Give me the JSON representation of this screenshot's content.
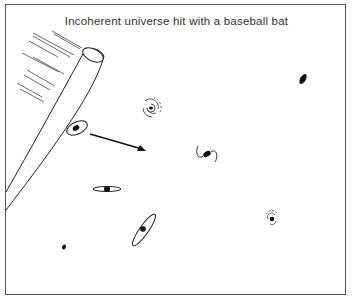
{
  "diagram": {
    "title": "Incoherent universe hit with a baseball bat",
    "colors": {
      "ink": "#1a1a1a",
      "frame": "#555555",
      "background": "#ffffff"
    },
    "elements": [
      {
        "kind": "baseball-bat",
        "description": "Bat entering from left edge, tip at upper right",
        "speed_lines": 8
      },
      {
        "kind": "galaxy-ring-tilted",
        "description": "Galaxy being hit by bat",
        "x": 76,
        "y": 128
      },
      {
        "kind": "arrow",
        "description": "Direction of motion after hit",
        "from": [
          96,
          136
        ],
        "to": [
          146,
          151
        ]
      },
      {
        "kind": "galaxy-spiral",
        "x": 151,
        "y": 108
      },
      {
        "kind": "galaxy-elliptical",
        "x": 303,
        "y": 80
      },
      {
        "kind": "galaxy-barred",
        "x": 207,
        "y": 155
      },
      {
        "kind": "galaxy-edge-on",
        "x": 107,
        "y": 189
      },
      {
        "kind": "galaxy-spiral-small",
        "x": 272,
        "y": 219
      },
      {
        "kind": "galaxy-ring-diagonal",
        "x": 144,
        "y": 230
      },
      {
        "kind": "galaxy-dwarf",
        "x": 64,
        "y": 247
      }
    ]
  }
}
